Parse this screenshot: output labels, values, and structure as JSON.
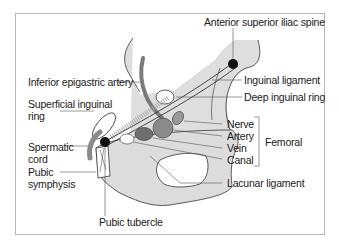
{
  "diagram": {
    "labels": {
      "anterior_superior_iliac_spine": "Anterior superior iliac spine",
      "inferior_epigastric_artery": "Inferior epigastric artery",
      "inguinal_ligament": "Inguinal ligament",
      "deep_inguinal_ring": "Deep inguinal ring",
      "superficial_inguinal_ring_1": "Superficial inguinal",
      "superficial_inguinal_ring_2": "ring",
      "spermatic_cord_1": "Spermatic",
      "spermatic_cord_2": "cord",
      "pubic_symphysis_1": "Pubic",
      "pubic_symphysis_2": "symphysis",
      "pubic_tubercle": "Pubic tubercle",
      "lacunar_ligament": "Lacunar ligament",
      "femoral_nerve": "Nerve",
      "femoral_artery": "Artery",
      "femoral_vein": "Vein",
      "femoral_canal": "Canal",
      "femoral_group": "Femoral"
    },
    "colors": {
      "bone": "#dcdcdc",
      "vessel": "#8a8a8a",
      "vessel_dark": "#6e6e6e",
      "landmark": "#111111",
      "line": "#555555",
      "frame": "#b8b8b8"
    }
  }
}
